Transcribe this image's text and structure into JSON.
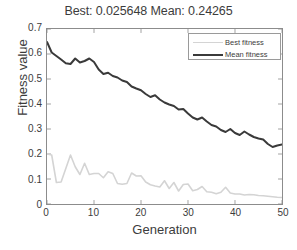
{
  "chart_data": {
    "type": "line",
    "title": "Best: 0.025648 Mean: 0.24265",
    "xlabel": "Generation",
    "ylabel": "Fitness value",
    "xlim": [
      0,
      50
    ],
    "ylim": [
      0,
      0.7
    ],
    "xticks": [
      0,
      10,
      20,
      30,
      40,
      50
    ],
    "xtick_labels": [
      "0",
      "10",
      "20",
      "30",
      "40",
      "50"
    ],
    "yticks": [
      0,
      0.1,
      0.2,
      0.3,
      0.4,
      0.5,
      0.6,
      0.7
    ],
    "ytick_labels": [
      "0",
      "0.1",
      "0.2",
      "0.3",
      "0.4",
      "0.5",
      "0.6",
      "0.7"
    ],
    "grid": false,
    "legend_position": "top-right",
    "x": [
      0,
      1,
      2,
      3,
      4,
      5,
      6,
      7,
      8,
      9,
      10,
      11,
      12,
      13,
      14,
      15,
      16,
      17,
      18,
      19,
      20,
      21,
      22,
      23,
      24,
      25,
      26,
      27,
      28,
      29,
      30,
      31,
      32,
      33,
      34,
      35,
      36,
      37,
      38,
      39,
      40,
      41,
      42,
      43,
      44,
      45,
      46,
      47,
      48,
      49,
      50
    ],
    "series": [
      {
        "name": "Best fitness",
        "color": "#d4d4d4",
        "width": 1.6,
        "values": [
          0.2,
          0.196,
          0.086,
          0.088,
          0.142,
          0.196,
          0.149,
          0.118,
          0.163,
          0.118,
          0.122,
          0.122,
          0.105,
          0.129,
          0.122,
          0.082,
          0.079,
          0.082,
          0.124,
          0.112,
          0.113,
          0.088,
          0.077,
          0.072,
          0.068,
          0.093,
          0.062,
          0.086,
          0.052,
          0.078,
          0.08,
          0.053,
          0.058,
          0.07,
          0.049,
          0.047,
          0.041,
          0.047,
          0.067,
          0.044,
          0.04,
          0.04,
          0.036,
          0.038,
          0.037,
          0.034,
          0.033,
          0.031,
          0.029,
          0.027,
          0.026
        ]
      },
      {
        "name": "Mean fitness",
        "color": "#3a3a3a",
        "width": 2.0,
        "values": [
          0.648,
          0.606,
          0.592,
          0.578,
          0.563,
          0.56,
          0.582,
          0.566,
          0.572,
          0.582,
          0.568,
          0.538,
          0.52,
          0.525,
          0.512,
          0.506,
          0.494,
          0.488,
          0.47,
          0.462,
          0.455,
          0.44,
          0.428,
          0.435,
          0.418,
          0.406,
          0.398,
          0.392,
          0.378,
          0.38,
          0.362,
          0.346,
          0.338,
          0.346,
          0.33,
          0.316,
          0.31,
          0.296,
          0.288,
          0.3,
          0.284,
          0.276,
          0.29,
          0.278,
          0.268,
          0.262,
          0.258,
          0.24,
          0.228,
          0.234,
          0.238
        ]
      }
    ],
    "legend": [
      {
        "label": "Best fitness",
        "color": "#d4d4d4"
      },
      {
        "label": "Mean fitness",
        "color": "#3a3a3a"
      }
    ]
  }
}
